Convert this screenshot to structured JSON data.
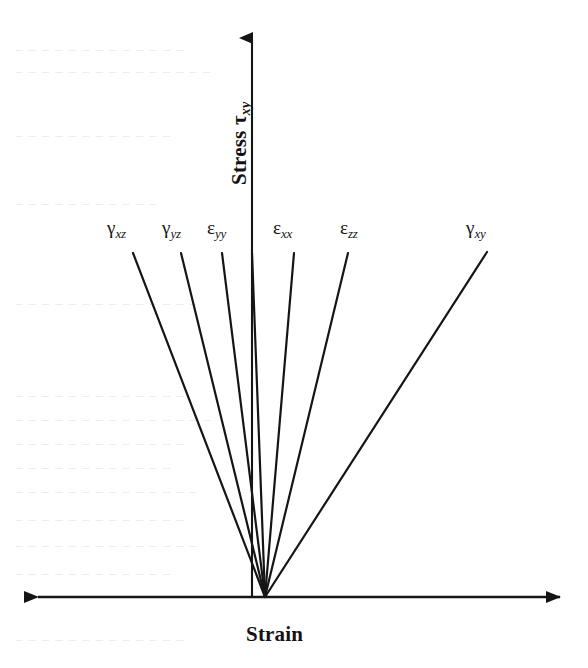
{
  "figure": {
    "kind": "schematic-line-chart",
    "background_color": "#ffffff",
    "ink_color": "#151515"
  },
  "axes": {
    "y": {
      "title_text": "Stress ",
      "title_symbol": "τ",
      "title_subscript": "xy",
      "arrow": "single-up",
      "origin_x": 252,
      "tip_y": 38,
      "base_y": 597
    },
    "x": {
      "title": "Strain",
      "arrow": "double-headed",
      "left_tip_x": 38,
      "right_tip_x": 560,
      "y": 597
    }
  },
  "chart_data": {
    "type": "line",
    "title": "",
    "xlabel": "Strain",
    "ylabel": "Stress τxy",
    "grid": false,
    "legend": "inline-end-labels",
    "axis_style": "arrow-axes-no-ticks",
    "xlim": [
      0,
      1
    ],
    "ylim": [
      0,
      1
    ],
    "note": "Schematic fan of straight lines radiating from the common origin on the strain axis; each ray has a different slope representing a different stress-strain response component. No numeric tick labels are printed on either axis.",
    "origin": {
      "x": 265,
      "y": 597
    },
    "series": [
      {
        "name": "γxz",
        "symbol": "γ",
        "subscript": "xz",
        "x1": 265,
        "y1": 597,
        "x2": 133,
        "y2": 253,
        "label_x": 107,
        "label_y": 218,
        "slope_rank": 1,
        "relative_slope": 2.61
      },
      {
        "name": "γyz",
        "symbol": "γ",
        "subscript": "yz",
        "x1": 265,
        "y1": 597,
        "x2": 181,
        "y2": 253,
        "label_x": 162,
        "label_y": 218,
        "slope_rank": 2,
        "relative_slope": 4.1
      },
      {
        "name": "εyy",
        "symbol": "ε",
        "subscript": "yy",
        "x1": 265,
        "y1": 597,
        "x2": 222,
        "y2": 253,
        "label_x": 207,
        "label_y": 218,
        "slope_rank": 3,
        "relative_slope": 8.0
      },
      {
        "name": "εxx",
        "symbol": "ε",
        "subscript": "xx",
        "x1": 265,
        "y1": 597,
        "x2": 294,
        "y2": 253,
        "label_x": 273,
        "label_y": 218,
        "slope_rank": 4,
        "relative_slope": -11.86
      },
      {
        "name": "εzz",
        "symbol": "ε",
        "subscript": "zz",
        "x1": 265,
        "y1": 597,
        "x2": 348,
        "y2": 253,
        "label_x": 340,
        "label_y": 218,
        "slope_rank": 5,
        "relative_slope": -4.14
      },
      {
        "name": "γxy",
        "symbol": "γ",
        "subscript": "xy",
        "x1": 265,
        "y1": 597,
        "x2": 487,
        "y2": 252,
        "label_x": 466,
        "label_y": 218,
        "slope_rank": 6,
        "relative_slope": -1.55
      },
      {
        "name": "stress-axis-overlay",
        "symbol": "",
        "subscript": "",
        "x1": 265,
        "y1": 597,
        "x2": 252,
        "y2": 253,
        "label_x": null,
        "label_y": null,
        "slope_rank": 0,
        "relative_slope": 26.46
      }
    ]
  },
  "ghost_text": {
    "description": "faint reverse-side print bleeding through the scanned page",
    "lines": [
      {
        "text": "− − − − −   − − − − − − − −",
        "x": 14,
        "y": 42
      },
      {
        "text": "− − − − − −   − − − − − − − − −",
        "x": 14,
        "y": 64
      },
      {
        "text": "− − − − − − − − − − − −",
        "x": 14,
        "y": 128
      },
      {
        "text": "− − − −   − − − − − − −",
        "x": 14,
        "y": 196
      },
      {
        "text": "− − − − − − − − − − − − − −",
        "x": 14,
        "y": 296
      },
      {
        "text": "− − − − − − − − − − − − −",
        "x": 14,
        "y": 388
      },
      {
        "text": "− − − − − − − − − − − − − − −",
        "x": 14,
        "y": 412
      },
      {
        "text": "− − − − − − − − − − − − −",
        "x": 14,
        "y": 436
      },
      {
        "text": "− − − − − − − − − − − −",
        "x": 14,
        "y": 460
      },
      {
        "text": "− − − − − − − − − − − − − −",
        "x": 14,
        "y": 484
      },
      {
        "text": "− − − − − − − − − − − − −",
        "x": 14,
        "y": 512
      },
      {
        "text": "− − − − − − − − − − − − − −",
        "x": 14,
        "y": 538
      },
      {
        "text": "− − − − − − − − − − − −",
        "x": 14,
        "y": 566
      },
      {
        "text": "− − − − − − − − − − − − −",
        "x": 14,
        "y": 632
      }
    ]
  }
}
